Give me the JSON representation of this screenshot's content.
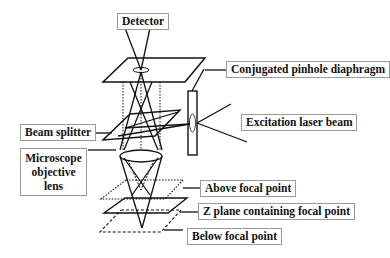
{
  "diagram": {
    "labels": {
      "detector": "Detector",
      "pinhole": "Conjugated pinhole diaphragm",
      "laser": "Excitation laser beam",
      "beam_splitter": "Beam splitter",
      "objective": "Microscope objective lens",
      "above": "Above focal point",
      "zplane": "Z plane containing focal point",
      "below": "Below focal point"
    },
    "planes": [
      {
        "name": "above-focal-plane",
        "style": "dotted"
      },
      {
        "name": "z-focal-plane",
        "style": "solid"
      },
      {
        "name": "below-focal-plane",
        "style": "dashed"
      }
    ],
    "colors": {
      "line": "#111111",
      "label_border": "#9a9a9a",
      "background": "#ffffff"
    }
  }
}
